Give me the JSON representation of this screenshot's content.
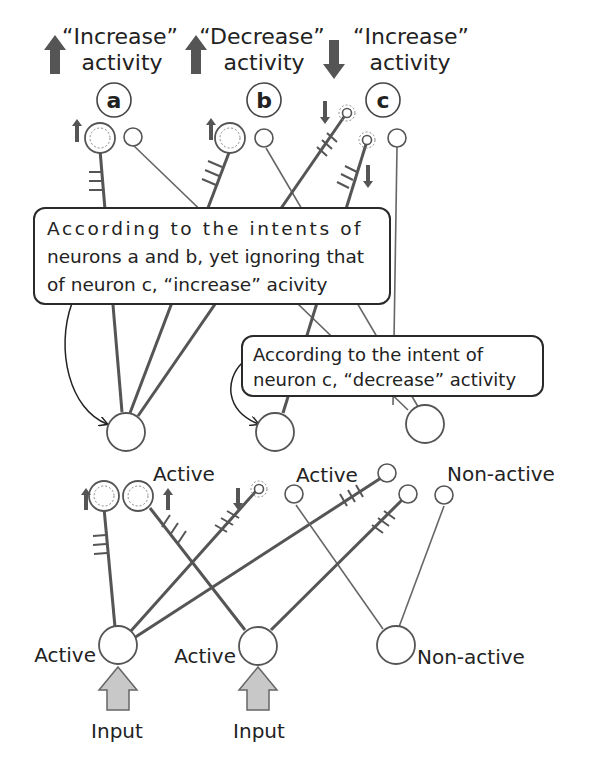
{
  "header": {
    "neuron_a": {
      "letter": "a",
      "intent_line1": "“Increase”",
      "intent_line2": "activity",
      "arrow": "up-arrow-icon"
    },
    "neuron_b": {
      "letter": "b",
      "intent_line1": "“Decrease”",
      "intent_line2": "activity",
      "arrow": "up-arrow-icon"
    },
    "neuron_c": {
      "letter": "c",
      "intent_line1": "“Increase”",
      "intent_line2": "activity",
      "arrow": "down-arrow-icon"
    }
  },
  "callouts": {
    "ab_callout": {
      "lines": [
        "According to the intents of",
        "neurons a and b, yet ignoring that",
        "of neuron c, “increase” acivity"
      ]
    },
    "c_callout": {
      "lines": [
        "According to the intent of",
        "neuron c, “decrease” activity"
      ]
    }
  },
  "middle_layer": [
    {
      "state": "Active"
    },
    {
      "state": "Active"
    },
    {
      "state": "Non-active"
    }
  ],
  "bottom_layer": [
    {
      "state": "Active",
      "input_label": "Input"
    },
    {
      "state": "Active",
      "input_label": "Input"
    },
    {
      "state": "Non-active"
    }
  ],
  "colors": {
    "strong_line": "#555555",
    "weak_line": "#6a6a6a",
    "arrow_fill": "#555555",
    "input_arrow_fill": "#c8c8c8",
    "outline": "#444444",
    "dotted": "#888888"
  }
}
